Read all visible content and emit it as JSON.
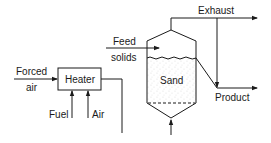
{
  "diagram": {
    "type": "process-flow",
    "nodes": {
      "heater": {
        "label": "Heater"
      },
      "vessel": {
        "label": "Sand"
      }
    },
    "streams": {
      "forced_air": {
        "line1": "Forced",
        "line2": "air"
      },
      "fuel": {
        "label": "Fuel"
      },
      "air": {
        "label": "Air"
      },
      "feed": {
        "line1": "Feed",
        "line2": "solids"
      },
      "exhaust": {
        "label": "Exhaust"
      },
      "product": {
        "label": "Product"
      }
    },
    "colors": {
      "line": "#1a1a1a",
      "background": "#ffffff"
    }
  }
}
